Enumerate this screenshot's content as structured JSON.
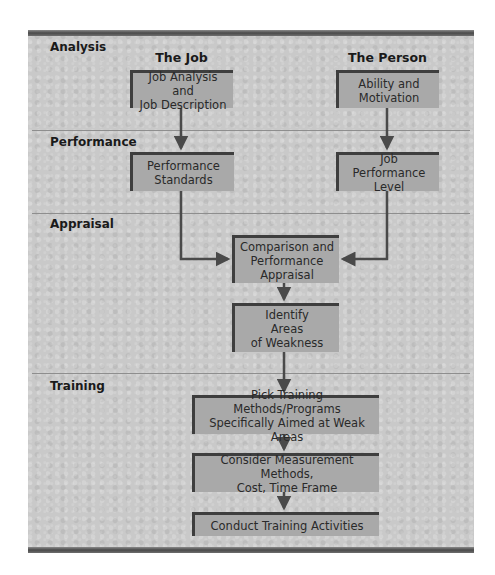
{
  "sections": {
    "analysis": "Analysis",
    "performance": "Performance",
    "appraisal": "Appraisal",
    "training": "Training"
  },
  "columns": {
    "job": "The Job",
    "person": "The Person"
  },
  "boxes": {
    "job_analysis": [
      "Job Analysis and",
      "Job Description"
    ],
    "ability": [
      "Ability and",
      "Motivation"
    ],
    "performance_standards": [
      "Performance",
      "Standards"
    ],
    "job_performance_level": [
      "Job Performance",
      "Level"
    ],
    "comparison": [
      "Comparison and",
      "Performance",
      "Appraisal"
    ],
    "identify": [
      "Identify",
      "Areas",
      "of Weakness"
    ],
    "pick_training": [
      "Pick Training Methods/Programs",
      "Specifically Aimed at Weak Areas"
    ],
    "consider": [
      "Consider Measurement Methods,",
      "Cost, Time Frame"
    ],
    "conduct": [
      "Conduct Training Activities"
    ]
  },
  "colors": {
    "panel": "#c9c9c9",
    "box": "#a9a9a9",
    "box_border": "#3e3e3e",
    "arrow": "#4a4a4a"
  }
}
